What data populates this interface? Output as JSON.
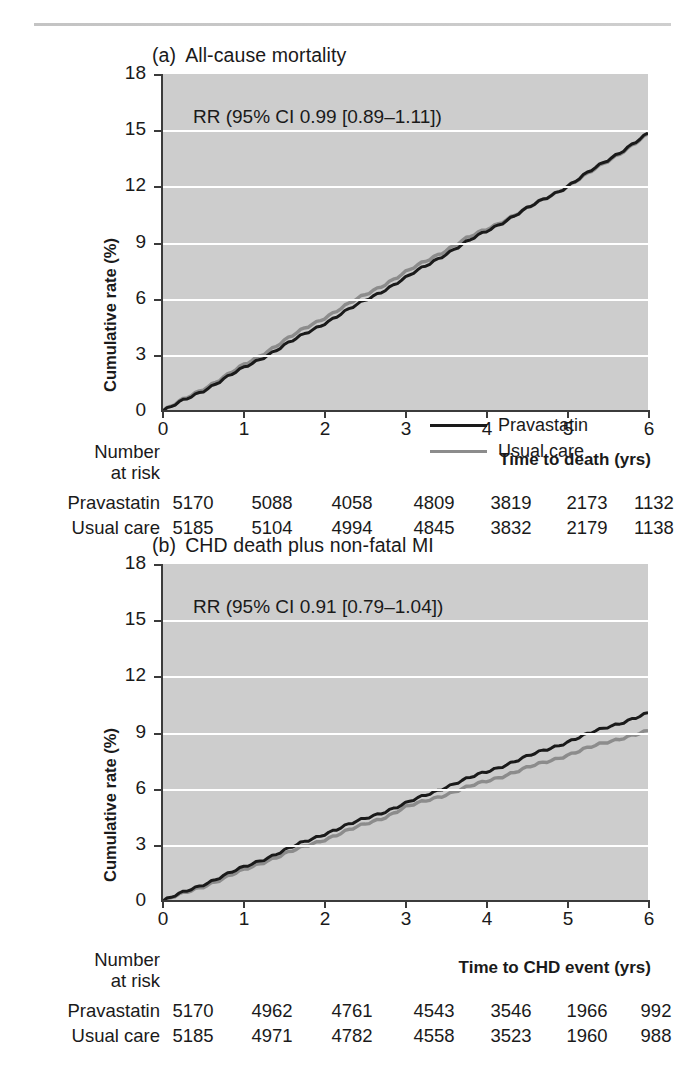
{
  "figure": {
    "background": "#ffffff",
    "plot_background": "#cdcdcd",
    "gridline_color": "#ffffff",
    "pravastatin_color": "#1a1a1a",
    "usual_care_color": "#8c8c8c"
  },
  "panels": [
    {
      "id": "a",
      "tag": "(a)",
      "title": "All-cause mortality",
      "annotation": "RR (95% CI 0.99 [0.89–1.11])",
      "xlabel": "Time to death (yrs)",
      "ylabel": "Cumulative rate (%)",
      "legend": [
        {
          "label": "Pravastatin",
          "color": "#1a1a1a"
        },
        {
          "label": "Usual care",
          "color": "#8c8c8c"
        }
      ],
      "risk_table": {
        "header_line1": "Number",
        "header_line2": "at risk",
        "rows": [
          {
            "label": "Pravastatin",
            "values": [
              "5170",
              "5088",
              "4058",
              "4809",
              "3819",
              "2173",
              "1132"
            ]
          },
          {
            "label": "Usual care",
            "values": [
              "5185",
              "5104",
              "4994",
              "4845",
              "3832",
              "2179",
              "1138"
            ]
          }
        ]
      }
    },
    {
      "id": "b",
      "tag": "(b)",
      "title": "CHD death plus non-fatal MI",
      "annotation": "RR (95% CI 0.91 [0.79–1.04])",
      "xlabel": "Time to CHD event (yrs)",
      "ylabel": "Cumulative rate (%)",
      "legend": [],
      "risk_table": {
        "header_line1": "Number",
        "header_line2": "at risk",
        "rows": [
          {
            "label": "Pravastatin",
            "values": [
              "5170",
              "4962",
              "4761",
              "4543",
              "3546",
              "1966",
              "992"
            ]
          },
          {
            "label": "Usual care",
            "values": [
              "5185",
              "4971",
              "4782",
              "4558",
              "3523",
              "1960",
              "988"
            ]
          }
        ]
      }
    }
  ],
  "chart_data": [
    {
      "type": "line",
      "panel": "a",
      "title": "(a) All-cause mortality",
      "xlabel": "Time to death (yrs)",
      "ylabel": "Cumulative rate (%)",
      "xlim": [
        0,
        6
      ],
      "ylim": [
        0,
        18
      ],
      "xticks": [
        0,
        1,
        2,
        3,
        4,
        5,
        6
      ],
      "yticks": [
        0,
        3,
        6,
        9,
        12,
        15,
        18
      ],
      "grid": "horizontal",
      "legend_position": "lower-right-inside",
      "annotation": "RR (95% CI 0.99 [0.89–1.11])",
      "x": [
        0,
        0.25,
        0.5,
        0.75,
        1,
        1.25,
        1.5,
        1.75,
        2,
        2.25,
        2.5,
        2.75,
        3,
        3.25,
        3.5,
        3.75,
        4,
        4.25,
        4.5,
        4.75,
        5,
        5.25,
        5.5,
        5.75,
        6
      ],
      "series": [
        {
          "name": "Pravastatin",
          "color": "#1a1a1a",
          "values": [
            0.0,
            0.55,
            1.1,
            1.7,
            2.3,
            2.9,
            3.5,
            4.1,
            4.7,
            5.3,
            5.9,
            6.5,
            7.1,
            7.75,
            8.4,
            9.0,
            9.6,
            10.2,
            10.8,
            11.4,
            12.0,
            12.7,
            13.4,
            14.1,
            14.8
          ]
        },
        {
          "name": "Usual care",
          "color": "#8c8c8c",
          "values": [
            0.0,
            0.6,
            1.2,
            1.8,
            2.45,
            3.1,
            3.75,
            4.4,
            5.0,
            5.6,
            6.2,
            6.8,
            7.4,
            8.0,
            8.6,
            9.2,
            9.7,
            10.25,
            10.8,
            11.4,
            12.0,
            12.65,
            13.35,
            14.05,
            14.75
          ]
        }
      ]
    },
    {
      "type": "line",
      "panel": "b",
      "title": "(b) CHD death plus non-fatal MI",
      "xlabel": "Time to CHD event (yrs)",
      "ylabel": "Cumulative rate (%)",
      "xlim": [
        0,
        6
      ],
      "ylim": [
        0,
        18
      ],
      "xticks": [
        0,
        1,
        2,
        3,
        4,
        5,
        6
      ],
      "yticks": [
        0,
        3,
        6,
        9,
        12,
        15,
        18
      ],
      "grid": "horizontal",
      "legend_position": "none",
      "annotation": "RR (95% CI 0.91 [0.79–1.04])",
      "x": [
        0,
        0.25,
        0.5,
        0.75,
        1,
        1.25,
        1.5,
        1.75,
        2,
        2.25,
        2.5,
        2.75,
        3,
        3.25,
        3.5,
        3.75,
        4,
        4.25,
        4.5,
        4.75,
        5,
        5.25,
        5.5,
        5.75,
        6
      ],
      "series": [
        {
          "name": "Pravastatin",
          "color": "#1a1a1a",
          "values": [
            0.0,
            0.45,
            0.9,
            1.35,
            1.8,
            2.25,
            2.7,
            3.15,
            3.6,
            4.0,
            4.4,
            4.8,
            5.2,
            5.65,
            6.1,
            6.5,
            6.9,
            7.3,
            7.7,
            8.1,
            8.5,
            8.9,
            9.3,
            9.65,
            10.0
          ]
        },
        {
          "name": "Usual care",
          "color": "#8c8c8c",
          "values": [
            0.0,
            0.4,
            0.8,
            1.2,
            1.65,
            2.1,
            2.5,
            2.9,
            3.3,
            3.7,
            4.1,
            4.5,
            5.0,
            5.35,
            5.7,
            6.05,
            6.4,
            6.75,
            7.1,
            7.45,
            7.8,
            8.15,
            8.5,
            8.8,
            9.05
          ]
        }
      ]
    }
  ]
}
